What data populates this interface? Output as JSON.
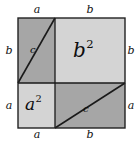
{
  "figure": {
    "type": "geometric-diagram",
    "canvas": {
      "width": 137,
      "height": 143,
      "background": "#ffffff"
    },
    "outer_square": {
      "x": 18,
      "y": 18,
      "width": 107,
      "height": 110,
      "side_expression": "a + b",
      "stroke": "#222222",
      "stroke_width": 1.4
    },
    "split": {
      "vertical_x": 55,
      "horizontal_y": 83
    },
    "colors": {
      "light_fill": "#d4d4d4",
      "dark_fill": "#a6a6a6",
      "line": "#1a1a1a",
      "text": "#111111",
      "background": "#ffffff"
    },
    "regions": [
      {
        "name": "top-left-rectangle",
        "position": "top-left",
        "width_label": "a",
        "height_label": "b",
        "fill": "dark",
        "has_hypotenuse": true,
        "hypotenuse_label": "c",
        "area_label": ""
      },
      {
        "name": "b-squared-square",
        "position": "top-right",
        "width_label": "b",
        "height_label": "b",
        "fill": "light",
        "has_hypotenuse": false,
        "hypotenuse_label": "",
        "area_label": "b",
        "area_exponent": "2"
      },
      {
        "name": "a-squared-square",
        "position": "bottom-left",
        "width_label": "a",
        "height_label": "a",
        "fill": "light",
        "has_hypotenuse": false,
        "hypotenuse_label": "",
        "area_label": "a",
        "area_exponent": "2"
      },
      {
        "name": "bottom-right-rectangle",
        "position": "bottom-right",
        "width_label": "b",
        "height_label": "a",
        "fill": "dark",
        "has_hypotenuse": true,
        "hypotenuse_label": "c",
        "area_label": ""
      }
    ],
    "edge_labels": {
      "top_left": "a",
      "top_right": "b",
      "left_upper": "b",
      "left_lower": "a",
      "right_upper": "b",
      "right_lower": "a",
      "bottom_left": "a",
      "bottom_right": "b"
    },
    "hypotenuse_labels": {
      "top_left_c": "c",
      "bottom_right_c": "c"
    },
    "area_labels": {
      "b_squared_base": "b",
      "b_squared_exp": "2",
      "a_squared_base": "a",
      "a_squared_exp": "2"
    }
  }
}
